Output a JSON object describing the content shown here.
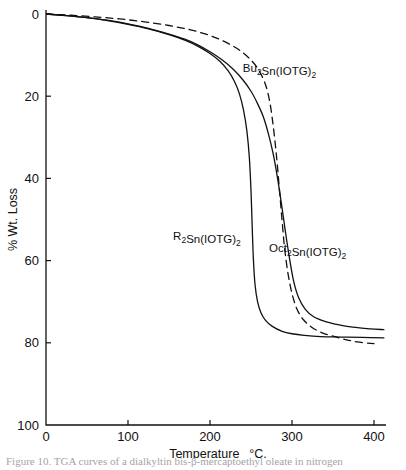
{
  "figure": {
    "caption_partial": "Figure 10.  TGA curves of a dialkyltin bis-β-mercaptoethyl oleate in nitrogen"
  },
  "chart_data": {
    "type": "line",
    "title": "",
    "xlabel": "Temperature",
    "xunit": "°C.",
    "ylabel": "% Wt. Loss",
    "xlim": [
      0,
      400
    ],
    "ylim": [
      0,
      100
    ],
    "y_inverted": true,
    "grid": false,
    "legend_position": "inline-annotations",
    "xticks": [
      0,
      100,
      200,
      300,
      400
    ],
    "xticklabels": [
      "0",
      "100",
      "200",
      "300",
      "400"
    ],
    "yticks": [
      0,
      20,
      40,
      60,
      80,
      100
    ],
    "yticklabels": [
      "0",
      "20",
      "40",
      "60",
      "80",
      "100"
    ],
    "series": [
      {
        "name": "R2Sn(IOTG)2",
        "label_html": "R<sub>2</sub>Sn(IOTG)<sub>2</sub>",
        "style": "solid",
        "color": "#111111",
        "annotation_x": 155,
        "annotation_y": 55,
        "points": [
          [
            0,
            0
          ],
          [
            25,
            0.4
          ],
          [
            50,
            0.9
          ],
          [
            75,
            1.6
          ],
          [
            100,
            2.5
          ],
          [
            125,
            3.6
          ],
          [
            150,
            5.0
          ],
          [
            170,
            6.4
          ],
          [
            185,
            7.8
          ],
          [
            200,
            9.6
          ],
          [
            212,
            11.5
          ],
          [
            222,
            13.8
          ],
          [
            230,
            16.5
          ],
          [
            236,
            19.5
          ],
          [
            241,
            23.5
          ],
          [
            245,
            28.5
          ],
          [
            248,
            35.0
          ],
          [
            250,
            43.0
          ],
          [
            251.5,
            52.0
          ],
          [
            253,
            60.0
          ],
          [
            255,
            66.0
          ],
          [
            258,
            70.0
          ],
          [
            262,
            72.6
          ],
          [
            268,
            74.6
          ],
          [
            276,
            76.0
          ],
          [
            288,
            77.2
          ],
          [
            300,
            77.8
          ],
          [
            315,
            78.2
          ],
          [
            335,
            78.5
          ],
          [
            360,
            78.6
          ],
          [
            385,
            78.7
          ],
          [
            412,
            78.8
          ]
        ]
      },
      {
        "name": "Bu2Sn(IOTG)2",
        "label_html": "Bu<sub>2</sub>Sn(IOTG)<sub>2</sub>",
        "style": "dashed",
        "color": "#111111",
        "annotation_x": 240,
        "annotation_y": 14,
        "points": [
          [
            0,
            0
          ],
          [
            30,
            0.3
          ],
          [
            60,
            0.7
          ],
          [
            90,
            1.2
          ],
          [
            120,
            1.9
          ],
          [
            150,
            2.8
          ],
          [
            175,
            3.8
          ],
          [
            195,
            4.9
          ],
          [
            212,
            6.2
          ],
          [
            228,
            7.8
          ],
          [
            240,
            9.4
          ],
          [
            250,
            11.2
          ],
          [
            258,
            13.2
          ],
          [
            264,
            15.4
          ],
          [
            269,
            18.0
          ],
          [
            273,
            21.5
          ],
          [
            276,
            25.5
          ],
          [
            279,
            30.5
          ],
          [
            282,
            36.5
          ],
          [
            285,
            43.5
          ],
          [
            288,
            50.5
          ],
          [
            291,
            57.0
          ],
          [
            295,
            63.0
          ],
          [
            300,
            68.0
          ],
          [
            306,
            71.8
          ],
          [
            314,
            74.4
          ],
          [
            324,
            76.2
          ],
          [
            336,
            77.5
          ],
          [
            350,
            78.4
          ],
          [
            365,
            79.2
          ],
          [
            380,
            79.8
          ],
          [
            400,
            80.2
          ]
        ]
      },
      {
        "name": "Oct2Sn(IOTG)2",
        "label_html": "Oct<sub>2</sub>Sn(IOTG)<sub>2</sub>",
        "style": "solid",
        "color": "#111111",
        "annotation_x": 272,
        "annotation_y": 58,
        "points": [
          [
            0,
            0
          ],
          [
            25,
            0.4
          ],
          [
            50,
            0.9
          ],
          [
            75,
            1.5
          ],
          [
            100,
            2.4
          ],
          [
            125,
            3.5
          ],
          [
            150,
            4.9
          ],
          [
            170,
            6.2
          ],
          [
            185,
            7.5
          ],
          [
            200,
            9.2
          ],
          [
            215,
            11.2
          ],
          [
            228,
            13.4
          ],
          [
            240,
            16.0
          ],
          [
            250,
            18.8
          ],
          [
            258,
            21.8
          ],
          [
            265,
            25.0
          ],
          [
            271,
            29.0
          ],
          [
            277,
            34.0
          ],
          [
            282,
            39.5
          ],
          [
            287,
            46.0
          ],
          [
            292,
            53.0
          ],
          [
            297,
            59.5
          ],
          [
            302,
            65.0
          ],
          [
            308,
            69.0
          ],
          [
            316,
            71.8
          ],
          [
            326,
            73.6
          ],
          [
            340,
            74.8
          ],
          [
            356,
            75.6
          ],
          [
            374,
            76.2
          ],
          [
            395,
            76.6
          ],
          [
            412,
            76.8
          ]
        ]
      }
    ]
  }
}
